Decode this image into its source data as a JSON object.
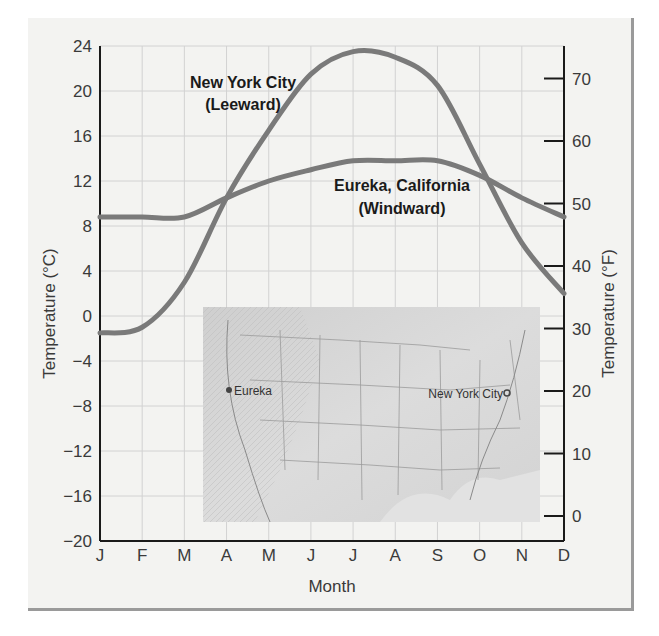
{
  "chart_data": {
    "type": "line",
    "title": "",
    "xlabel": "Month",
    "ylabel": "Temperature (°C)",
    "ylabel_right": "Temperature (°F)",
    "categories": [
      "J",
      "F",
      "M",
      "A",
      "M",
      "J",
      "J",
      "A",
      "S",
      "O",
      "N",
      "D"
    ],
    "ylim": [
      -20,
      24
    ],
    "yticks": [
      24,
      20,
      16,
      12,
      8,
      4,
      0,
      -4,
      -8,
      -12,
      -16,
      -20
    ],
    "ytick_labels": [
      "24",
      "20",
      "16",
      "12",
      "8",
      "4",
      "0",
      "−4",
      "−8",
      "−12",
      "−16",
      "−20"
    ],
    "yticks_right_f": [
      70,
      60,
      50,
      40,
      30,
      20,
      10,
      0
    ],
    "grid": true,
    "series": [
      {
        "name": "New York City (Leeward)",
        "label_line1": "New York City",
        "label_line2": "(Leeward)",
        "values": [
          -1.5,
          -1,
          3,
          10.5,
          16.5,
          21.5,
          23.5,
          23,
          20.5,
          13.5,
          6.5,
          2
        ],
        "color": "#7a7a7a"
      },
      {
        "name": "Eureka, California (Windward)",
        "label_line1": "Eureka, California",
        "label_line2": "(Windward)",
        "values": [
          8.8,
          8.8,
          8.8,
          10.5,
          12,
          13,
          13.8,
          13.8,
          13.8,
          12.5,
          10.5,
          8.8
        ],
        "color": "#7a7a7a"
      }
    ],
    "inset_map": {
      "description": "Relief map of the contiguous United States",
      "markers": [
        {
          "label": "Eureka"
        },
        {
          "label": "New York City"
        }
      ]
    }
  }
}
